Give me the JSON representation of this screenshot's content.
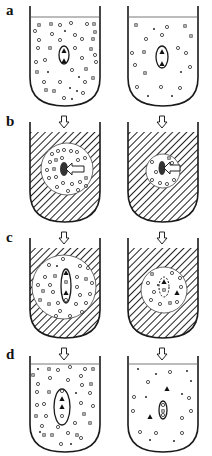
{
  "figure": {
    "panels": [
      {
        "label": "a",
        "description": "Suspensions with cells; left dense particles, right sparse particles; oval cell containing two triangles"
      },
      {
        "label": "b",
        "description": "Hatched medium applied (arrow down); circular cleared region with particles and arrow pointing into cell"
      },
      {
        "label": "c",
        "description": "Hatched medium with larger cleared circular region; elongated cell with particles"
      },
      {
        "label": "d",
        "description": "Medium removed; left dense particles with cell containing triangles, right sparse with small cell and free triangles"
      }
    ],
    "colors": {
      "line": "#1a1a1a",
      "background": "#ffffff",
      "particle": "#444444"
    }
  }
}
